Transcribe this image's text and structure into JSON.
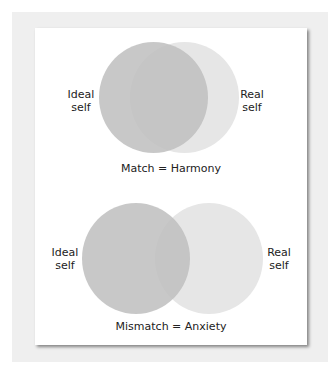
{
  "diagrams": [
    {
      "caption": "Match = Harmony",
      "left_label": [
        "Ideal",
        "self"
      ],
      "right_label": [
        "Real",
        "self"
      ]
    },
    {
      "caption": "Mismatch = Anxiety",
      "left_label": [
        "Ideal",
        "self"
      ],
      "right_label": [
        "Real",
        "self"
      ]
    }
  ],
  "colors": {
    "ideal_circle": "#c4c4c4",
    "real_circle": "#e6e6e6",
    "overlap": "#cfcfcf"
  }
}
